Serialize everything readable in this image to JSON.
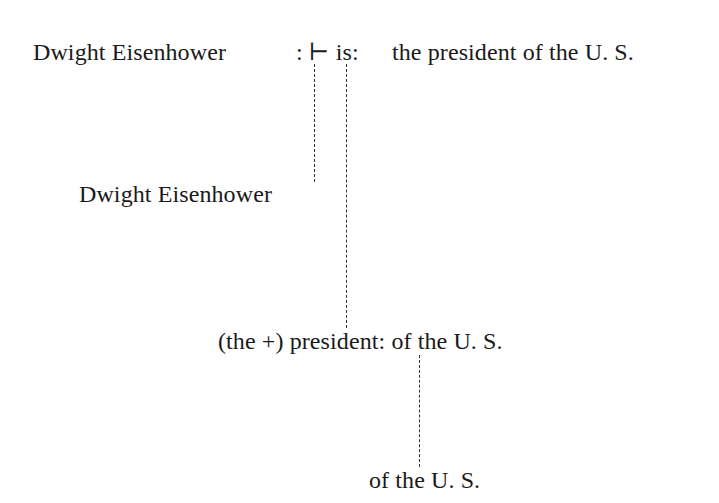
{
  "diagram": {
    "type": "tree",
    "row1": {
      "subject": "Dwight Eisenhower",
      "operator": ": ⊢ is:",
      "predicate": "the president of the U. S."
    },
    "row2": {
      "label": "Dwight Eisenhower"
    },
    "row3": {
      "label": "(the +) president: of the U. S."
    },
    "row4": {
      "label": "of the U. S."
    },
    "edges": [
      {
        "from": ":⊢",
        "to": "Dwight Eisenhower"
      },
      {
        "from": "is:",
        "to": "(the +) president: of the U. S."
      },
      {
        "from": "president:",
        "to": "of the U. S."
      }
    ],
    "line_style": "dashed",
    "line_color": "#333333"
  }
}
